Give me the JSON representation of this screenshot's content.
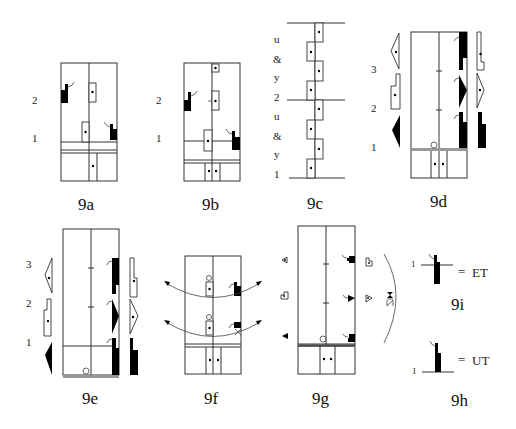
{
  "figures": [
    {
      "id": "9a",
      "caption": "9a",
      "floor_labels": [
        "2",
        "1"
      ]
    },
    {
      "id": "9b",
      "caption": "9b",
      "floor_labels": [
        "2",
        "1"
      ]
    },
    {
      "id": "9c",
      "caption": "9c",
      "side_labels": [
        "u",
        "&",
        "y",
        "2",
        "u",
        "&",
        "y",
        "1"
      ]
    },
    {
      "id": "9d",
      "caption": "9d",
      "floor_labels": [
        "3",
        "2",
        "1"
      ]
    },
    {
      "id": "9e",
      "caption": "9e",
      "floor_labels": [
        "3",
        "2",
        "1"
      ]
    },
    {
      "id": "9f",
      "caption": "9f"
    },
    {
      "id": "9g",
      "caption": "9g"
    },
    {
      "id": "9i",
      "caption": "9i",
      "level_label": "1",
      "equals": "=",
      "term": "ET"
    },
    {
      "id": "9h",
      "caption": "9h",
      "level_label": "1",
      "equals": "=",
      "term": "UT"
    }
  ],
  "colors": {
    "line": "#333333",
    "fill": "#000000",
    "background": "#ffffff"
  }
}
